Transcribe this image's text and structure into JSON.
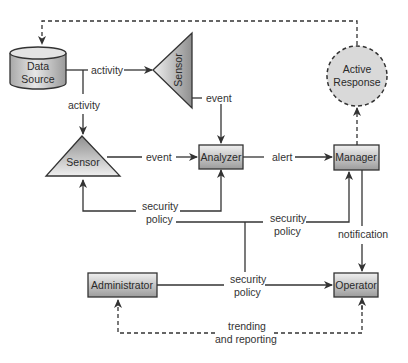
{
  "nodes": {
    "data_source": {
      "line1": "Data",
      "line2": "Source",
      "shape": "cylinder"
    },
    "sensor_top": {
      "label": "Sensor",
      "shape": "triangle-left"
    },
    "sensor_left": {
      "label": "Sensor",
      "shape": "triangle-up"
    },
    "analyzer": {
      "label": "Analyzer",
      "shape": "box"
    },
    "manager": {
      "label": "Manager",
      "shape": "box"
    },
    "active_response": {
      "line1": "Active",
      "line2": "Response",
      "shape": "dashed-circle"
    },
    "administrator": {
      "label": "Administrator",
      "shape": "box"
    },
    "operator": {
      "label": "Operator",
      "shape": "box"
    }
  },
  "edges": {
    "activity_right": "activity",
    "activity_down": "activity",
    "event_top": "event",
    "event_left": "event",
    "alert": "alert",
    "policy_sensor_l1": "security",
    "policy_sensor_l2": "policy",
    "policy_manager_l1": "security",
    "policy_manager_l2": "policy",
    "policy_operator_l1": "security",
    "policy_operator_l2": "policy",
    "notification": "notification",
    "trending_l1": "trending",
    "trending_l2": "and reporting"
  },
  "colors": {
    "stroke": "#333333",
    "node_fill_light": "#e8e8e8",
    "node_fill_dark": "#a8a8a8",
    "active_response_fill": "#d9d9d9"
  }
}
